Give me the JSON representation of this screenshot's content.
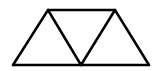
{
  "diagram": {
    "stroke_color": "#000000",
    "background_color": "#ffffff",
    "stroke_width": 2.5,
    "vertices": {
      "bottom_left": [
        13,
        65
      ],
      "bottom_middle": [
        81,
        65
      ],
      "bottom_right": [
        149,
        65
      ],
      "top_left": [
        48,
        10
      ],
      "top_right": [
        115,
        10
      ]
    },
    "segments": [
      [
        "bottom_left",
        "bottom_right"
      ],
      [
        "top_left",
        "top_right"
      ],
      [
        "bottom_left",
        "top_left"
      ],
      [
        "top_left",
        "bottom_middle"
      ],
      [
        "bottom_middle",
        "top_right"
      ],
      [
        "top_right",
        "bottom_right"
      ]
    ]
  }
}
